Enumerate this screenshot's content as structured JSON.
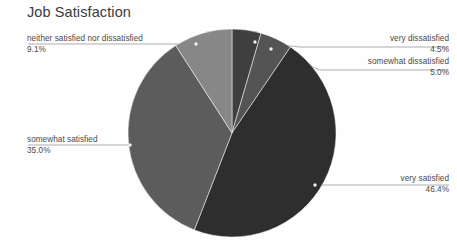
{
  "chart": {
    "title": "Job Satisfaction"
  },
  "chart_data": {
    "type": "pie",
    "title": "Job Satisfaction",
    "xlabel": "",
    "ylabel": "",
    "legend_position": "none",
    "grid": false,
    "labels_outside": true,
    "start_angle_deg": 0,
    "direction": "clockwise",
    "categories": [
      "very dissatisfied",
      "somewhat dissatisfied",
      "very satisfied",
      "somewhat satisfied",
      "neither satisfied nor dissatisfied"
    ],
    "values": [
      4.5,
      5.0,
      46.4,
      35.0,
      9.1
    ],
    "value_labels": [
      "4.5%",
      "5.0%",
      "46.4%",
      "35.0%",
      "9.1%"
    ],
    "colors": [
      "#3f3f3f",
      "#545454",
      "#2e2e2e",
      "#5c5c5c",
      "#878787"
    ],
    "units": "percent",
    "slices": [
      {
        "name": "very dissatisfied",
        "value": 4.5,
        "value_label": "4.5%",
        "color": "#3f3f3f",
        "start_deg": 0.0,
        "end_deg": 16.2
      },
      {
        "name": "somewhat dissatisfied",
        "value": 5.0,
        "value_label": "5.0%",
        "color": "#545454",
        "start_deg": 16.2,
        "end_deg": 34.2
      },
      {
        "name": "very satisfied",
        "value": 46.4,
        "value_label": "46.4%",
        "color": "#2e2e2e",
        "start_deg": 34.2,
        "end_deg": 201.24
      },
      {
        "name": "somewhat satisfied",
        "value": 35.0,
        "value_label": "35.0%",
        "color": "#5c5c5c",
        "start_deg": 201.24,
        "end_deg": 327.24
      },
      {
        "name": "neither satisfied nor dissatisfied",
        "value": 9.1,
        "value_label": "9.1%",
        "color": "#878787",
        "start_deg": 327.24,
        "end_deg": 360.0
      }
    ]
  },
  "labels": {
    "neither": {
      "name": "neither satisfied nor dissatisfied",
      "value": "9.1%"
    },
    "somewhat_satisfied": {
      "name": "somewhat satisfied",
      "value": "35.0%"
    },
    "very_dissatisfied": {
      "name": "very dissatisfied",
      "value": "4.5%"
    },
    "somewhat_dissatisfied": {
      "name": "somewhat dissatisfied",
      "value": "5.0%"
    },
    "very_satisfied": {
      "name": "very satisfied",
      "value": "46.4%"
    }
  },
  "style": {
    "background": "#fefefe",
    "title_color": "#3b3b3b",
    "label_color": "#4a4a4a",
    "leader_color": "#9a9a9a",
    "marker_color": "#f2f2f2"
  }
}
